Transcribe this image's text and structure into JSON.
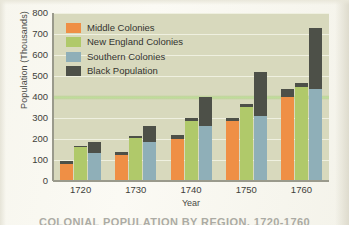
{
  "chart_data": {
    "type": "bar",
    "title": "",
    "caption": "COLONIAL POPULATION BY REGION, 1720-1760",
    "xlabel": "Year",
    "ylabel": "Population (Thousands)",
    "categories": [
      "1720",
      "1730",
      "1740",
      "1750",
      "1760"
    ],
    "ylim": [
      0,
      800
    ],
    "yticks": [
      0,
      100,
      200,
      300,
      400,
      500,
      600,
      700,
      800
    ],
    "grid": true,
    "legend_position": "upper-left",
    "stacked_groups": true,
    "note": "Within each year there are three bars (Middle, New England, Southern Colonies); each bar is topped by a stacked dark 'Black Population' segment. Values listed are the coloured region segment and the black segment that sits on top of it.",
    "series": [
      {
        "name": "Middle Colonies",
        "color": "#ef8f45",
        "values": [
          82,
          126,
          200,
          287,
          400
        ]
      },
      {
        "name": "New England Colonies",
        "color": "#b0c96a",
        "values": [
          162,
          205,
          288,
          354,
          448
        ]
      },
      {
        "name": "Southern Colonies",
        "color": "#8fafb8",
        "values": [
          132,
          184,
          261,
          310,
          438
        ]
      },
      {
        "name": "Black Population",
        "color": "#4d5048",
        "stacked_on": [
          "Middle Colonies",
          "New England Colonies",
          "Southern Colonies"
        ],
        "values_on_middle": [
          13,
          12,
          17,
          13,
          40
        ],
        "values_on_new_england": [
          4,
          8,
          12,
          11,
          20
        ],
        "values_on_southern": [
          56,
          78,
          139,
          208,
          292
        ]
      }
    ],
    "bar_totals": {
      "1720": {
        "middle": 95,
        "new_england": 166,
        "southern": 188
      },
      "1730": {
        "middle": 138,
        "new_england": 213,
        "southern": 262
      },
      "1740": {
        "middle": 217,
        "new_england": 300,
        "southern": 400
      },
      "1750": {
        "middle": 300,
        "new_england": 365,
        "southern": 518
      },
      "1760": {
        "middle": 440,
        "new_england": 468,
        "southern": 730
      }
    }
  },
  "legend": {
    "items": [
      {
        "label": "Middle Colonies",
        "color": "#ef8f45"
      },
      {
        "label": "New England Colonies",
        "color": "#b0c96a"
      },
      {
        "label": "Southern Colonies",
        "color": "#8fafb8"
      },
      {
        "label": "Black Population",
        "color": "#4d5048"
      }
    ]
  },
  "colors": {
    "plot_background": "#d8d9bd",
    "gridline": "#f3f3e6",
    "axis": "#9a9a8c",
    "text": "#3e3e3a"
  }
}
